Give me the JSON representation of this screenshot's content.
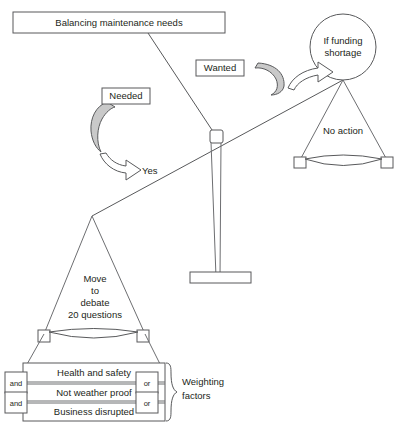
{
  "diagram": {
    "title_box": {
      "label": "Balancing maintenance needs"
    },
    "left_side": {
      "ribbon_label": "Needed",
      "arrow_label": "Yes",
      "pan_lines": [
        "Move",
        "to",
        "debate",
        "20 questions"
      ]
    },
    "right_side": {
      "ribbon_label": "Wanted",
      "circle_lines": [
        "If funding",
        "shortage"
      ],
      "pan_label": "No action"
    },
    "weighting": {
      "bracket_lines": [
        "Weighting",
        "factors"
      ],
      "rows": [
        {
          "label": "Health and safety"
        },
        {
          "label": "Not weather proof"
        },
        {
          "label": "Business disrupted"
        }
      ],
      "left_connectors": [
        {
          "label": "and"
        },
        {
          "label": "and"
        }
      ],
      "right_connectors": [
        {
          "label": "or"
        },
        {
          "label": "or"
        }
      ]
    },
    "colors": {
      "line": "#58595b",
      "ribbon_fill": "#c9c9c9",
      "text": "#231f20",
      "background": "#ffffff"
    }
  }
}
